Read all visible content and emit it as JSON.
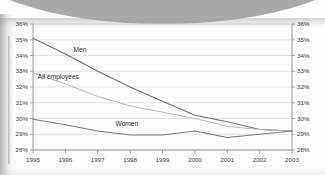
{
  "chart_data": {
    "type": "line",
    "title": "",
    "subtitle": "",
    "xlabel": "",
    "ylabel": "",
    "x": [
      1995,
      1996,
      1997,
      1998,
      1999,
      2000,
      2001,
      2002,
      2003
    ],
    "xtick_labels": [
      "1995",
      "1996",
      "1997",
      "1998",
      "1999",
      "2000",
      "2001",
      "2002",
      "2003"
    ],
    "xlim": [
      1995,
      2003
    ],
    "ylim": [
      28,
      36
    ],
    "ytick_labels_left": [
      "36%",
      "35%",
      "34%",
      "33%",
      "32%",
      "31%",
      "30%",
      "29%",
      "28%"
    ],
    "ytick_labels_right": [
      "36%",
      "35%",
      "34%",
      "33%",
      "32%",
      "31%",
      "30%",
      "29%",
      "28%"
    ],
    "ytick_values": [
      36,
      35,
      34,
      33,
      32,
      31,
      30,
      29,
      28
    ],
    "grid": true,
    "grid_axis": "y",
    "legend_position": "inline-annotations",
    "series": [
      {
        "name": "Men",
        "label": "Men",
        "color": "#6e6e6e",
        "values": [
          35.1,
          34.1,
          33.0,
          32.0,
          31.1,
          30.2,
          29.8,
          29.3,
          29.2
        ]
      },
      {
        "name": "All employees",
        "label": "All employees",
        "color": "#b4b4b4",
        "values": [
          32.9,
          32.2,
          31.4,
          30.8,
          30.4,
          30.0,
          29.5,
          29.3,
          29.2
        ]
      },
      {
        "name": "Women",
        "label": "Women",
        "color": "#7a7a7a",
        "values": [
          29.95,
          29.6,
          29.2,
          28.95,
          28.95,
          29.2,
          28.8,
          29.0,
          29.2
        ]
      }
    ],
    "annotations": [
      {
        "text": "Men",
        "series": "Men",
        "x": 1996.25,
        "y": 34.25
      },
      {
        "text": "All employees",
        "series": "All employees",
        "x": 1995.15,
        "y": 32.5
      },
      {
        "text": "Women",
        "series": "Women",
        "x": 1997.55,
        "y": 29.55
      }
    ]
  },
  "colors": {
    "men": "#6e6e6e",
    "all_employees": "#b4b4b4",
    "women": "#7a7a7a",
    "grid": "#c9c9c9",
    "axis": "#8e8e8e",
    "text": "#3b3b3b",
    "page": "#fdfdfd",
    "scan_shadow": "#9a9a9a"
  }
}
